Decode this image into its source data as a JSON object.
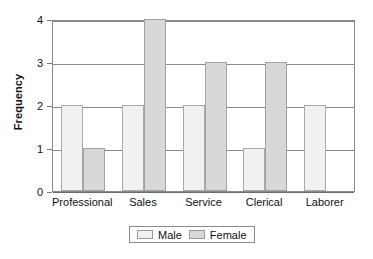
{
  "chart_data": {
    "type": "bar",
    "title": "",
    "subtitle": "",
    "xlabel": "",
    "ylabel": "Frequency",
    "categories": [
      "Professional",
      "Sales",
      "Service",
      "Clerical",
      "Laborer"
    ],
    "series": [
      {
        "name": "Male",
        "color": "#f1f1f1",
        "values": [
          2,
          2,
          2,
          1,
          2
        ]
      },
      {
        "name": "Female",
        "color": "#d8d8d8",
        "values": [
          1,
          4,
          3,
          3,
          0
        ]
      }
    ],
    "ylim": [
      0,
      4
    ],
    "yticks": [
      0,
      1,
      2,
      3,
      4
    ],
    "ytick_labels": [
      "0",
      "1",
      "2",
      "3",
      "4"
    ],
    "grid": true,
    "grid_axis": "y",
    "legend_position": "bottom",
    "bar_mode": "grouped",
    "axis_color": "#8a8a8a",
    "background": "#ffffff"
  },
  "legend": {
    "entries": [
      {
        "label": "Male"
      },
      {
        "label": "Female"
      }
    ]
  }
}
